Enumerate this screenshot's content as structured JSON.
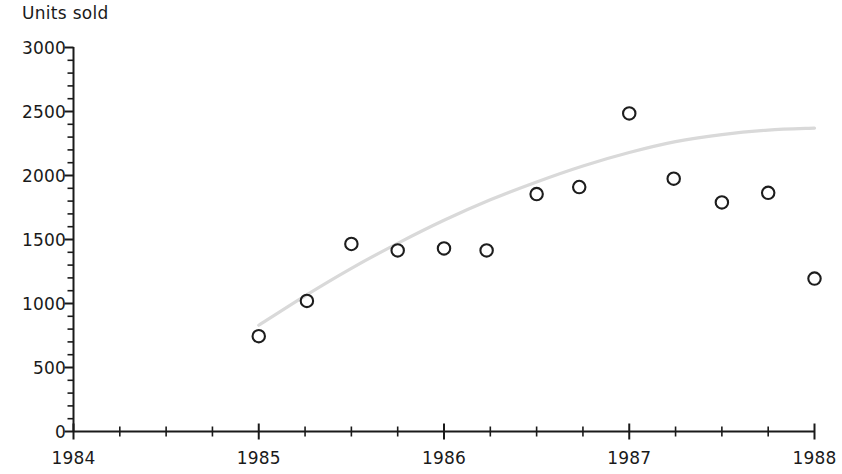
{
  "chart": {
    "ylabel": "Units sold",
    "background_color": "#ffffff",
    "axis_color": "#1a1a1a",
    "marker_color": "#1d1d1d",
    "trend_color": "#d9d9d9"
  },
  "chart_data": {
    "type": "scatter",
    "title": "",
    "xlabel": "",
    "ylabel": "Units sold",
    "xlim": [
      1984,
      1988
    ],
    "ylim": [
      0,
      3000
    ],
    "grid": false,
    "legend": null,
    "x_ticks": [
      1984,
      1985,
      1986,
      1987,
      1988
    ],
    "x_tick_labels": [
      "1984",
      "1985",
      "1986",
      "1987",
      "1988"
    ],
    "x_minor_ticks_per_interval": 4,
    "y_ticks": [
      0,
      500,
      1000,
      1500,
      2000,
      2500,
      3000
    ],
    "y_tick_labels": [
      "0",
      "500",
      "1000",
      "1500",
      "2000",
      "2500",
      "3000"
    ],
    "y_minor_tick_step": 100,
    "series": [
      {
        "name": "Units sold",
        "marker": "open-circle",
        "x": [
          1985.0,
          1985.26,
          1985.5,
          1985.75,
          1986.0,
          1986.23,
          1986.5,
          1986.73,
          1987.0,
          1987.24,
          1987.5,
          1987.75,
          1988.0
        ],
        "values": [
          745,
          1020,
          1465,
          1415,
          1430,
          1415,
          1855,
          1910,
          2485,
          1975,
          1790,
          1865,
          1195
        ]
      },
      {
        "name": "trend",
        "type": "line",
        "x": [
          1985.0,
          1985.25,
          1985.5,
          1985.75,
          1986.0,
          1986.25,
          1986.5,
          1986.75,
          1987.0,
          1987.25,
          1987.5,
          1987.75,
          1988.0
        ],
        "values": [
          830,
          1060,
          1275,
          1470,
          1650,
          1810,
          1950,
          2075,
          2180,
          2265,
          2320,
          2355,
          2370
        ]
      }
    ]
  }
}
